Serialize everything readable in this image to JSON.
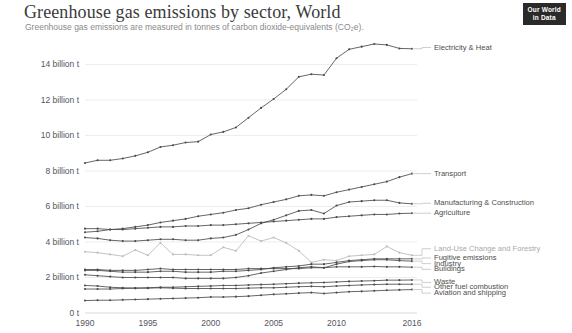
{
  "header": {
    "title": "Greenhouse gas emissions by sector, World",
    "subtitle": "Greenhouse gas emissions are measured in tonnes of carbon dioxide-equivalents (CO₂e).",
    "logo_line1": "Our World",
    "logo_line2": "in Data"
  },
  "chart_data": {
    "type": "line",
    "title": "Greenhouse gas emissions by sector, World",
    "subtitle": "Greenhouse gas emissions are measured in tonnes of carbon dioxide-equivalents (CO₂e).",
    "xlabel": "",
    "ylabel": "",
    "unit": "tonnes CO₂e",
    "grid": true,
    "legend_position": "right-inline-labels",
    "xlim": [
      1990,
      2016
    ],
    "ylim": [
      0,
      15.6
    ],
    "x_ticks": [
      1990,
      1995,
      2000,
      2005,
      2010,
      2016
    ],
    "x_tick_labels": [
      "1990",
      "1995",
      "2000",
      "2005",
      "2010",
      "2016"
    ],
    "y_ticks": [
      0,
      2,
      4,
      6,
      8,
      10,
      12,
      14
    ],
    "y_tick_labels": [
      "0 t",
      "2 billion t",
      "4 billion t",
      "6 billion t",
      "8 billion t",
      "10 billion t",
      "12 billion t",
      "14 billion t"
    ],
    "x": [
      1990,
      1991,
      1992,
      1993,
      1994,
      1995,
      1996,
      1997,
      1998,
      1999,
      2000,
      2001,
      2002,
      2003,
      2004,
      2005,
      2006,
      2007,
      2008,
      2009,
      2010,
      2011,
      2012,
      2013,
      2014,
      2015,
      2016
    ],
    "series": [
      {
        "name": "Electricity & Heat",
        "label_y": 14.95,
        "faint": false,
        "values": [
          8.45,
          8.6,
          8.6,
          8.7,
          8.85,
          9.05,
          9.35,
          9.45,
          9.6,
          9.65,
          10.05,
          10.2,
          10.45,
          11.0,
          11.55,
          12.05,
          12.6,
          13.3,
          13.45,
          13.4,
          14.35,
          14.85,
          15.0,
          15.15,
          15.1,
          14.9,
          14.88
        ]
      },
      {
        "name": "Transport",
        "label_y": 7.85,
        "faint": false,
        "values": [
          4.55,
          4.6,
          4.7,
          4.75,
          4.85,
          4.95,
          5.1,
          5.2,
          5.3,
          5.45,
          5.55,
          5.65,
          5.8,
          5.9,
          6.1,
          6.25,
          6.4,
          6.6,
          6.65,
          6.6,
          6.8,
          6.95,
          7.1,
          7.25,
          7.4,
          7.65,
          7.85
        ]
      },
      {
        "name": "Manufacturing & Construction",
        "label_y": 6.18,
        "faint": false,
        "values": [
          4.25,
          4.2,
          4.1,
          4.05,
          4.05,
          4.1,
          4.15,
          4.15,
          4.1,
          4.1,
          4.2,
          4.25,
          4.4,
          4.7,
          5.05,
          5.25,
          5.5,
          5.75,
          5.8,
          5.6,
          6.05,
          6.25,
          6.3,
          6.35,
          6.35,
          6.2,
          6.15
        ]
      },
      {
        "name": "Agriculture",
        "label_y": 5.62,
        "faint": false,
        "values": [
          4.75,
          4.75,
          4.7,
          4.7,
          4.75,
          4.8,
          4.85,
          4.85,
          4.9,
          4.9,
          4.95,
          4.95,
          5.0,
          5.05,
          5.1,
          5.15,
          5.2,
          5.25,
          5.3,
          5.3,
          5.4,
          5.45,
          5.5,
          5.55,
          5.55,
          5.6,
          5.62
        ]
      },
      {
        "name": "Land-Use Change and Forestry",
        "label_y": 3.62,
        "faint": true,
        "values": [
          3.45,
          3.4,
          3.3,
          3.2,
          3.55,
          3.25,
          3.95,
          3.3,
          3.3,
          3.25,
          3.25,
          3.7,
          3.5,
          4.35,
          4.05,
          4.25,
          3.95,
          3.5,
          2.85,
          3.0,
          2.95,
          3.2,
          3.25,
          3.3,
          3.75,
          3.4,
          3.25
        ]
      },
      {
        "name": "Fugitive emissions",
        "label_y": 3.1,
        "faint": false,
        "values": [
          2.4,
          2.4,
          2.35,
          2.3,
          2.3,
          2.3,
          2.35,
          2.35,
          2.3,
          2.3,
          2.3,
          2.35,
          2.35,
          2.4,
          2.45,
          2.55,
          2.6,
          2.65,
          2.75,
          2.75,
          2.85,
          2.95,
          3.0,
          3.05,
          3.05,
          3.05,
          3.05
        ]
      },
      {
        "name": "Industry",
        "label_y": 2.78,
        "faint": false,
        "values": [
          2.15,
          2.1,
          2.05,
          2.0,
          2.0,
          2.0,
          2.0,
          2.0,
          1.95,
          1.95,
          1.95,
          1.95,
          2.0,
          2.1,
          2.25,
          2.35,
          2.45,
          2.55,
          2.6,
          2.55,
          2.75,
          2.9,
          2.95,
          3.0,
          3.0,
          2.95,
          2.92
        ]
      },
      {
        "name": "Buildings",
        "label_y": 2.46,
        "faint": false,
        "values": [
          2.45,
          2.45,
          2.4,
          2.4,
          2.4,
          2.45,
          2.5,
          2.45,
          2.45,
          2.45,
          2.45,
          2.45,
          2.45,
          2.5,
          2.5,
          2.5,
          2.5,
          2.5,
          2.55,
          2.55,
          2.6,
          2.6,
          2.6,
          2.62,
          2.6,
          2.6,
          2.58
        ]
      },
      {
        "name": "Waste",
        "label_y": 1.72,
        "faint": false,
        "values": [
          1.35,
          1.35,
          1.35,
          1.38,
          1.4,
          1.42,
          1.45,
          1.45,
          1.48,
          1.5,
          1.52,
          1.55,
          1.55,
          1.58,
          1.6,
          1.62,
          1.65,
          1.68,
          1.7,
          1.72,
          1.75,
          1.78,
          1.8,
          1.82,
          1.85,
          1.85,
          1.86
        ]
      },
      {
        "name": "Other fuel combustion",
        "label_y": 1.45,
        "faint": false,
        "values": [
          1.55,
          1.52,
          1.45,
          1.42,
          1.4,
          1.4,
          1.42,
          1.4,
          1.38,
          1.38,
          1.38,
          1.38,
          1.38,
          1.4,
          1.42,
          1.42,
          1.45,
          1.48,
          1.5,
          1.48,
          1.52,
          1.55,
          1.58,
          1.6,
          1.62,
          1.62,
          1.62
        ]
      },
      {
        "name": "Aviation and shipping",
        "label_y": 1.12,
        "faint": false,
        "values": [
          0.7,
          0.72,
          0.72,
          0.74,
          0.76,
          0.78,
          0.8,
          0.82,
          0.84,
          0.86,
          0.9,
          0.9,
          0.92,
          0.95,
          1.0,
          1.05,
          1.08,
          1.12,
          1.15,
          1.1,
          1.15,
          1.2,
          1.22,
          1.25,
          1.28,
          1.3,
          1.32
        ]
      }
    ]
  }
}
